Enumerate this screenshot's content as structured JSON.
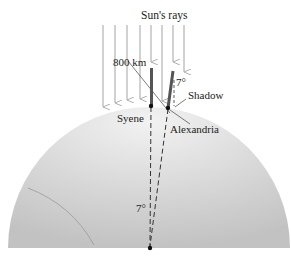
{
  "diagram": {
    "title": "Sun's rays",
    "labels": {
      "distance": "800 km",
      "shadow_angle": "7°",
      "shadow": "Shadow",
      "syene": "Syene",
      "alexandria": "Alexandria",
      "center_angle": "7°"
    },
    "colors": {
      "earth_fill_light": "#ececec",
      "earth_fill_dark": "#c4c4c4",
      "ray": "#b8b8b8",
      "stick": "#555555",
      "line": "#333333"
    }
  }
}
